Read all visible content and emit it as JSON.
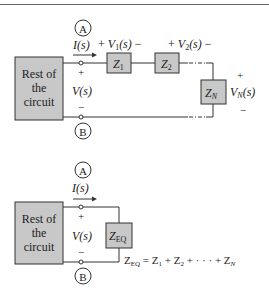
{
  "header": {
    "text": "5-2 CIRCUIT"
  },
  "series_circuit": {
    "block_label": [
      "Rest of",
      "the",
      "circuit"
    ],
    "node_top": "A",
    "node_bottom": "B",
    "current_label": "I(s)",
    "voltage_label": "V(s)",
    "plus": "+",
    "minus": "−",
    "v1_label": "+ V1(s) −",
    "v2_label": "+ V2(s) −",
    "vn_label": "VN(s)",
    "impedances": [
      "Z1",
      "Z2",
      "ZN"
    ]
  },
  "equivalent_circuit": {
    "block_label": [
      "Rest of",
      "the",
      "circuit"
    ],
    "node_top": "A",
    "node_bottom": "B",
    "current_label": "I(s)",
    "voltage_label": "V(s)",
    "plus": "+",
    "minus": "−",
    "impedance": "ZEQ",
    "equation": "ZEQ = Z1 + Z2 + ··· + ZN"
  },
  "colors": {
    "block_fill": "#c8c8c8",
    "line": "#333333"
  }
}
